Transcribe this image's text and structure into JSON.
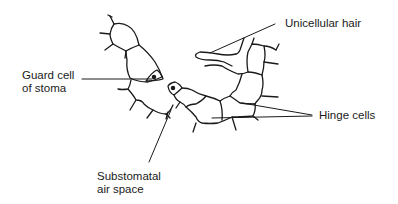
{
  "diagram": {
    "labels": {
      "guard_cell_line1": "Guard cell",
      "guard_cell_line2": "of stoma",
      "substomatal_line1": "Substomatal",
      "substomatal_line2": "air space",
      "unicellular_hair": "Unicellular hair",
      "hinge_cells": "Hinge cells"
    },
    "colors": {
      "background": "#ffffff",
      "line": "#1a1a1a",
      "text": "#1a1a1a"
    }
  }
}
